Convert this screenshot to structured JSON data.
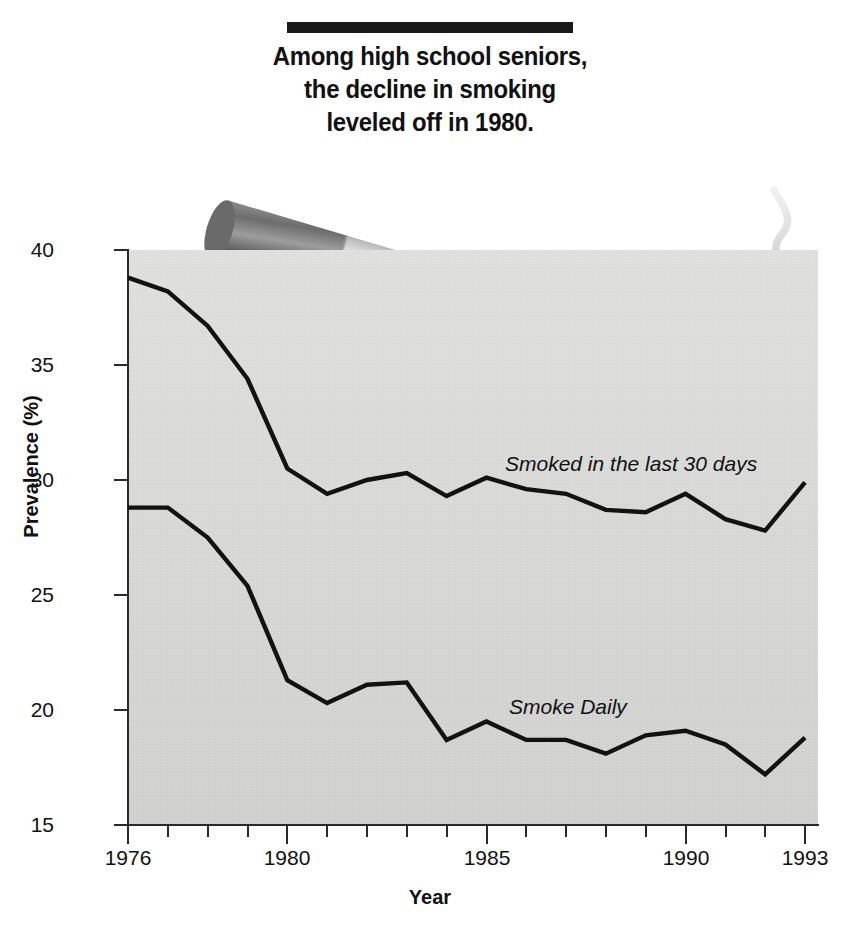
{
  "title": {
    "lines": [
      "Among high school seniors,",
      "the decline in smoking",
      "leveled off in 1980."
    ]
  },
  "illustration": {
    "name": "cigarette-with-smoke",
    "description": "Lit cigarette angled down to the right with rising smoke wisp"
  },
  "colors": {
    "plot_background": "#d8d8d7",
    "line": "#121212",
    "axis": "#2a2a2a",
    "title_rule": "#1a1a1a",
    "text": "#111111"
  },
  "axes": {
    "y_label": "Prevalence (%)",
    "x_label": "Year",
    "y_ticks": [
      "40",
      "35",
      "30",
      "25",
      "20",
      "15"
    ],
    "x_tick_labels": [
      "1976",
      "1980",
      "1985",
      "1990",
      "1993"
    ]
  },
  "chart_data": {
    "type": "line",
    "title": "Among high school seniors, the decline in smoking leveled off in 1980.",
    "xlabel": "Year",
    "ylabel": "Prevalence (%)",
    "xlim": [
      1976,
      1993
    ],
    "ylim": [
      15,
      40
    ],
    "grid": false,
    "legend_position": "inline-labels",
    "x": [
      1976,
      1977,
      1978,
      1979,
      1980,
      1981,
      1982,
      1983,
      1984,
      1985,
      1986,
      1987,
      1988,
      1989,
      1990,
      1991,
      1992,
      1993
    ],
    "series": [
      {
        "name": "Smoked in the last 30 days",
        "values": [
          38.8,
          38.2,
          36.7,
          34.4,
          30.5,
          29.4,
          30.0,
          30.3,
          29.3,
          30.1,
          29.6,
          29.4,
          28.7,
          28.6,
          29.4,
          28.3,
          27.8,
          29.9
        ]
      },
      {
        "name": "Smoke Daily",
        "values": [
          28.8,
          28.8,
          27.5,
          25.4,
          21.3,
          20.3,
          21.1,
          21.2,
          18.7,
          19.5,
          18.7,
          18.7,
          18.1,
          18.9,
          19.1,
          18.5,
          17.2,
          18.8
        ]
      }
    ]
  }
}
